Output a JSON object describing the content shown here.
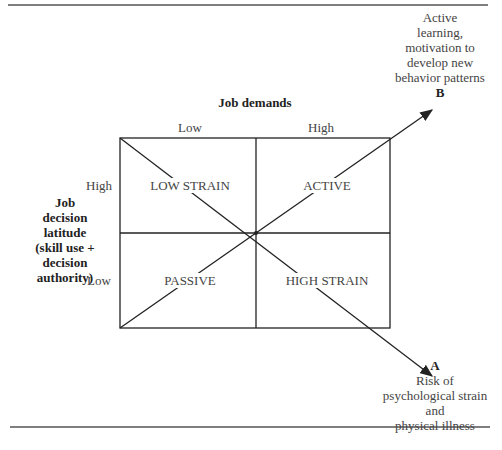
{
  "title": "Job demands",
  "x_axis": {
    "label": "Job demands",
    "low": "Low",
    "high": "High"
  },
  "y_axis": {
    "lines": [
      "Job",
      "decision",
      "latitude",
      "(skill use +",
      "decision",
      "authority)"
    ],
    "high": "High",
    "low": "Low"
  },
  "quadrants": {
    "top_left": "LOW STRAIN",
    "top_right": "ACTIVE",
    "bottom_left": "PASSIVE",
    "bottom_right": "HIGH STRAIN"
  },
  "arrow_b": {
    "letter": "B",
    "lines": [
      "Active",
      "learning,",
      "motivation to",
      "develop new",
      "behavior patterns"
    ]
  },
  "arrow_a": {
    "letter": "A",
    "lines": [
      "Risk of",
      "psychological strain",
      "and",
      "physical illness"
    ]
  },
  "colors": {
    "line": "#222222",
    "text": "#444444",
    "rule": "#555555"
  }
}
